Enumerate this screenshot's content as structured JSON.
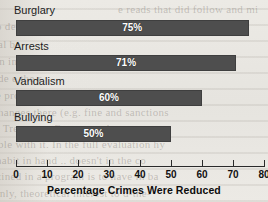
{
  "chart_data": {
    "type": "bar",
    "orientation": "horizontal",
    "title": "",
    "xlabel": "Percentage Crimes Were Reduced",
    "ylabel": "",
    "categories": [
      "Burglary",
      "Arrests",
      "Vandalism",
      "Bullying"
    ],
    "values": [
      75,
      71,
      60,
      50
    ],
    "value_labels": [
      "75%",
      "71%",
      "60%",
      "50%"
    ],
    "xlim": [
      0,
      80
    ],
    "xticks": [
      0,
      10,
      20,
      30,
      40,
      50,
      60,
      70,
      80
    ],
    "xtick_labels": [
      "0",
      "10",
      "20",
      "30",
      "40",
      "50",
      "60",
      "70",
      "80"
    ],
    "grid": false,
    "legend": null,
    "bar_color": "#4e4e4e",
    "value_label_color": "#ffffff",
    "background_color": "#eceae5"
  },
  "page_background": {
    "ghost_lines": [
      "e reads that did follow and mi",
      "o demonstrate the value of this interv",
      "al be",
      "en incited to change how they behave",
      "de e the r",
      "e progress with intervention as it",
      "hanges there (e.g. fine and sanctions",
      "d Treatment Constructed",
      "ble with it. In the full evaluation hy",
      "habit in hand .. doesn't in the co",
      "tined in a program is to have in ba",
      "only, theoretical interest to d-the-"
    ]
  }
}
